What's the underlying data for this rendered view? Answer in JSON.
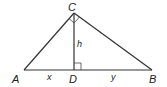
{
  "diagram": {
    "type": "right-triangle-with-altitude",
    "vertices": {
      "A": {
        "label": "A",
        "x": 24,
        "y": 70
      },
      "B": {
        "label": "B",
        "x": 152,
        "y": 70
      },
      "C": {
        "label": "C",
        "x": 74,
        "y": 13
      },
      "D": {
        "label": "D",
        "x": 74,
        "y": 70
      }
    },
    "segments": {
      "AD": {
        "label": "x"
      },
      "DB": {
        "label": "y"
      },
      "CD": {
        "label": "h"
      }
    },
    "right_angles": [
      "C",
      "D"
    ]
  }
}
